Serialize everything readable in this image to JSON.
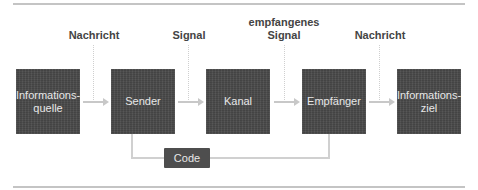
{
  "diagram": {
    "boxes": [
      {
        "id": "informationsquelle",
        "label": "Informations-\nquelle"
      },
      {
        "id": "sender",
        "label": "Sender"
      },
      {
        "id": "kanal",
        "label": "Kanal"
      },
      {
        "id": "empfaenger",
        "label": "Empfänger"
      },
      {
        "id": "informationsziel",
        "label": "Informations-\nziel"
      }
    ],
    "edge_labels": [
      {
        "between": [
          "informationsquelle",
          "sender"
        ],
        "label": "Nachricht"
      },
      {
        "between": [
          "sender",
          "kanal"
        ],
        "label": "Signal"
      },
      {
        "between": [
          "kanal",
          "empfaenger"
        ],
        "label": "empfangenes\nSignal"
      },
      {
        "between": [
          "empfaenger",
          "informationsziel"
        ],
        "label": "Nachricht"
      }
    ],
    "code_box": {
      "label": "Code",
      "connects": [
        "sender",
        "empfaenger"
      ]
    },
    "colors": {
      "box": "#4a4a4a",
      "box_text": "#e8e8e8",
      "label_text": "#444444",
      "arrow": "#c8c8c8",
      "rule": "#c4c4c4"
    }
  }
}
